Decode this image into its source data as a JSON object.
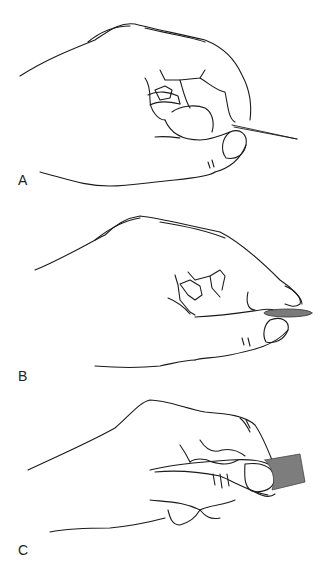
{
  "figure": {
    "panels": [
      {
        "label": "A",
        "description": "hand grasping a needle between thumb and finger"
      },
      {
        "label": "B",
        "description": "hand holding a coin between thumb and index finger pads"
      },
      {
        "label": "C",
        "description": "hand holding a flat block between thumb and fingers"
      }
    ],
    "colors": {
      "line": "#1a1a1a",
      "object_fill": "#7d7d7d",
      "background": "#ffffff"
    }
  }
}
